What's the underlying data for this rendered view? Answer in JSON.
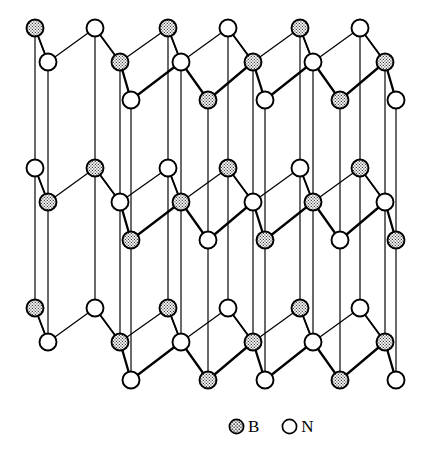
{
  "figure": {
    "background_color": "#ffffff",
    "line_color": "#000000"
  },
  "legend": {
    "position": "bottom-right",
    "entries": [
      {
        "symbol": "B",
        "label": "B",
        "marker": "filled-stippled-circle",
        "fill": "#b9b9b9",
        "stroke": "#000000"
      },
      {
        "symbol": "N",
        "label": "N",
        "marker": "open-circle",
        "fill": "#ffffff",
        "stroke": "#000000"
      }
    ]
  },
  "structure": {
    "type": "ball-and-stick-lattice",
    "layers": 3,
    "layer_names": [
      "top-layer",
      "middle-layer",
      "bottom-layer"
    ],
    "layer_y_offsets": [
      0,
      140,
      280
    ],
    "stacking": "AA' (B over N, N over B between adjacent layers)",
    "atom_radius": 8.5,
    "atom_colors": {
      "B": "#bdbdbd",
      "N": "#ffffff"
    },
    "back_row_y": 28,
    "mid_row_y": 62,
    "front_row_y": 100,
    "sheet": {
      "back_row": [
        {
          "x": 35,
          "type": "B"
        },
        {
          "x": 95,
          "type": "N"
        },
        {
          "x": 168,
          "type": "B"
        },
        {
          "x": 228,
          "type": "N"
        },
        {
          "x": 300,
          "type": "B"
        },
        {
          "x": 360,
          "type": "N"
        }
      ],
      "mid_row": [
        {
          "x": 48,
          "type": "N"
        },
        {
          "x": 120,
          "type": "B"
        },
        {
          "x": 181,
          "type": "N"
        },
        {
          "x": 253,
          "type": "B"
        },
        {
          "x": 313,
          "type": "N"
        },
        {
          "x": 385,
          "type": "B"
        }
      ],
      "front_row": [
        {
          "x": 131,
          "type": "N"
        },
        {
          "x": 208,
          "type": "B"
        },
        {
          "x": 265,
          "type": "N"
        },
        {
          "x": 340,
          "type": "B"
        },
        {
          "x": 396,
          "type": "N"
        }
      ]
    },
    "vertical_bond_count": 22,
    "note_layer_inversion": "middle layer swaps B and N site occupancy relative to top and bottom layers"
  }
}
